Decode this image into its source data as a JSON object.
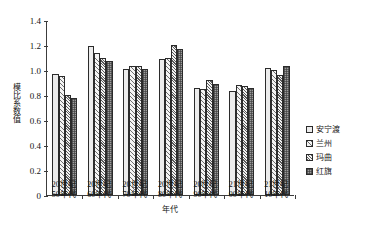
{
  "chart_data": {
    "type": "bar",
    "title": "",
    "xlabel": "年代",
    "ylabel": "模比系数值",
    "ylim": [
      0,
      1.4
    ],
    "ytick_values": [
      0,
      0.2,
      0.4,
      0.6,
      0.8,
      1.0,
      1.2,
      1.4
    ],
    "ytick_labels": [
      "0",
      "0.2",
      "0.4",
      "0.6",
      "0.8",
      "1.0",
      "1.2",
      "1.4"
    ],
    "grid": false,
    "legend_position": "right",
    "categories": [
      "20世纪\n50年代",
      "20世纪\n60年代",
      "20世纪\n70年代",
      "20世纪\n80年代",
      "20世纪\n90年代",
      "21世纪\n00年代",
      "21世纪\n10年代"
    ],
    "series": [
      {
        "name": "安宁渡",
        "values": [
          0.97,
          1.19,
          1.01,
          1.09,
          0.86,
          0.83,
          1.02
        ]
      },
      {
        "name": "兰州",
        "values": [
          0.95,
          1.14,
          1.03,
          1.1,
          0.85,
          0.88,
          1.0
        ]
      },
      {
        "name": "玛曲",
        "values": [
          0.8,
          1.1,
          1.03,
          1.2,
          0.92,
          0.87,
          0.96
        ]
      },
      {
        "name": "红旗",
        "values": [
          0.78,
          1.07,
          1.01,
          1.17,
          0.89,
          0.86,
          1.03
        ]
      }
    ]
  },
  "legend": {
    "items": [
      {
        "label": "安宁渡",
        "pattern": "fill-s0"
      },
      {
        "label": "兰州",
        "pattern": "fill-s1"
      },
      {
        "label": "玛曲",
        "pattern": "fill-s2"
      },
      {
        "label": "红旗",
        "pattern": "fill-s3"
      }
    ]
  }
}
